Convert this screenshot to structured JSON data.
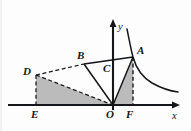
{
  "figure": {
    "background_color": "#fdfdfd",
    "stroke_color": "#15161a",
    "shade_color": "#a8a8a8",
    "axes": {
      "x_label": "x",
      "y_label": "y",
      "origin_label": "O"
    },
    "points": [
      {
        "id": "A",
        "label": "A",
        "x": 133,
        "y": 57,
        "label_x": 137,
        "label_y": 54
      },
      {
        "id": "B",
        "label": "B",
        "x": 84,
        "y": 64,
        "label_x": 77,
        "label_y": 59
      },
      {
        "id": "C",
        "label": "C",
        "x": 113,
        "y": 72,
        "label_x": 103,
        "label_y": 71
      },
      {
        "id": "D",
        "label": "D",
        "x": 36,
        "y": 75,
        "label_x": 24,
        "label_y": 74
      },
      {
        "id": "E",
        "label": "E",
        "x": 36,
        "y": 105,
        "label_x": 32,
        "label_y": 117
      },
      {
        "id": "O",
        "label": "O",
        "x": 113,
        "y": 105,
        "label_x": 106,
        "label_y": 117
      },
      {
        "id": "F",
        "label": "F",
        "x": 133,
        "y": 105,
        "label_x": 127,
        "label_y": 117
      }
    ],
    "axis_labels": [
      {
        "id": "x-axis-label",
        "text": "x",
        "x": 174,
        "y": 118
      },
      {
        "id": "y-axis-label",
        "text": "y",
        "x": 119,
        "y": 29
      }
    ],
    "segments": [
      {
        "id": "segment-BA",
        "from": "B",
        "to": "A",
        "style": "solid"
      },
      {
        "id": "segment-BO",
        "from": "B",
        "to": "O",
        "style": "solid"
      },
      {
        "id": "segment-AO",
        "from": "A",
        "to": "O",
        "style": "solid"
      },
      {
        "id": "segment-DB",
        "from": "D",
        "to": "B",
        "style": "dashed"
      },
      {
        "id": "segment-DE",
        "from": "D",
        "to": "E",
        "style": "dashed"
      },
      {
        "id": "segment-DO",
        "from": "D",
        "to": "O",
        "style": "dashed"
      },
      {
        "id": "segment-AF",
        "from": "A",
        "to": "F",
        "style": "dashed"
      }
    ],
    "shaded_regions": [
      {
        "id": "triangle-DEO",
        "vertices": [
          "D",
          "E",
          "O"
        ]
      },
      {
        "id": "triangle-OAF",
        "vertices": [
          "O",
          "A",
          "F"
        ]
      }
    ],
    "curve": {
      "id": "hyperbola-branch",
      "description": "inverse-proportion curve through A"
    }
  }
}
